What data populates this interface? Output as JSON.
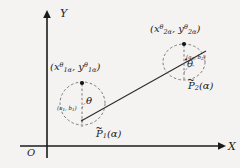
{
  "figure": {
    "type": "math-diagram",
    "background_color": "#f4f3f1",
    "stroke_color": "#1b1b1b",
    "width": 240,
    "height": 168
  },
  "axes": {
    "x_label": "X",
    "y_label": "Y",
    "origin_label": "O",
    "x_axis": {
      "x1": 20,
      "y1": 146,
      "x2": 224,
      "y2": 146,
      "arrow": "right"
    },
    "y_axis": {
      "x1": 47,
      "y1": 158,
      "x2": 47,
      "y2": 12,
      "arrow": "up"
    }
  },
  "shapes": {
    "connector_line": {
      "x1": 82,
      "y1": 120,
      "x2": 206,
      "y2": 51
    },
    "ellipse1": {
      "cx": 82.5,
      "cy": 103.5,
      "rx": 22.5,
      "ry": 21.5,
      "dashed": true
    },
    "ellipse2": {
      "cx": 184,
      "cy": 62,
      "rx": 21,
      "ry": 18,
      "dashed": true
    }
  },
  "region1": {
    "point_label": {
      "open": "(",
      "x_var": "x",
      "x_sub": "1α",
      "x_sup": "θ",
      "comma": ", ",
      "y_var": "y",
      "y_sub": "1α",
      "y_sup": "θ",
      "close": ")"
    },
    "center_label": "(a₁, b₁)",
    "center_label_parts": {
      "open": "(",
      "a": "a",
      "a_sub": "1",
      "sep": ", ",
      "b": "b",
      "b_sub": "1",
      "close": ")"
    },
    "angle_label": "θ",
    "set_label": {
      "accent": "~",
      "symbol": "P",
      "sub": "1",
      "arg": "(α)"
    },
    "dot": {
      "cx": 82,
      "cy": 83
    },
    "dashed_vertical": {
      "x": 82,
      "y1": 83,
      "y2": 126
    }
  },
  "region2": {
    "point_label": {
      "open": "(",
      "x_var": "x",
      "x_sub": "2α",
      "x_sup": "θ",
      "comma": ", ",
      "y_var": "y",
      "y_sub": "2α",
      "y_sup": "θ",
      "close": ")"
    },
    "center_label": "(a₂, b₂)",
    "center_label_parts": {
      "open": "(",
      "a": "a",
      "a_sub": "2",
      "sep": ", ",
      "b": "b",
      "b_sub": "2",
      "close": ")"
    },
    "angle_label": "θ",
    "set_label": {
      "accent": "~",
      "symbol": "P",
      "sub": "2",
      "arg": "(α)"
    },
    "dot": {
      "cx": 184,
      "cy": 44
    },
    "dashed_vertical": {
      "x": 184,
      "y1": 44,
      "y2": 81
    }
  }
}
